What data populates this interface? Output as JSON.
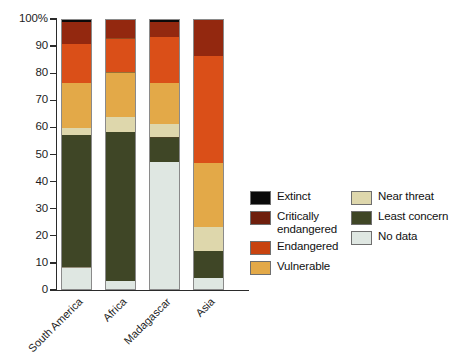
{
  "chart_data": {
    "type": "bar",
    "subtype": "stacked-percentage-column",
    "title": "",
    "xlabel": "",
    "ylabel": "",
    "ylim": [
      0,
      100
    ],
    "yticks": [
      0,
      10,
      20,
      30,
      40,
      50,
      60,
      70,
      80,
      90,
      100
    ],
    "ytick_labels": [
      "0",
      "10",
      "20",
      "30",
      "40",
      "50",
      "60",
      "70",
      "80",
      "90",
      "100%"
    ],
    "grid": false,
    "legend_position": "right",
    "categories": [
      "South America",
      "Africa",
      "Madagascar",
      "Asia"
    ],
    "series": [
      {
        "name": "No data",
        "color": "#dfe7e2",
        "values": [
          8.0,
          3.0,
          47.0,
          4.0
        ]
      },
      {
        "name": "Least concern",
        "color": "#3f4626",
        "values": [
          49.0,
          55.0,
          9.0,
          10.0
        ]
      },
      {
        "name": "Near threat",
        "color": "#ded7ac",
        "values": [
          2.5,
          5.5,
          5.0,
          9.0
        ]
      },
      {
        "name": "Vulnerable",
        "color": "#e3a948",
        "values": [
          16.5,
          16.5,
          15.0,
          23.5
        ]
      },
      {
        "name": "Endangered",
        "color": "#da4f18",
        "values": [
          14.5,
          12.5,
          17.0,
          39.5
        ]
      },
      {
        "name": "Critically endangered",
        "color": "#93280f",
        "values": [
          8.0,
          7.0,
          5.5,
          14.0
        ]
      },
      {
        "name": "Extinct",
        "color": "#0a0a0a",
        "values": [
          1.5,
          0.5,
          1.5,
          0.0
        ]
      }
    ]
  },
  "axis": {
    "y_unit_suffix": "%",
    "y_top_label": "100%"
  },
  "legend": {
    "columns": [
      {
        "items": [
          {
            "label": "Extinct",
            "color": "#0a0a0a"
          },
          {
            "label": "Critically endangered",
            "color": "#6f1f0d"
          },
          {
            "label": "Endangered",
            "color": "#c8430f"
          },
          {
            "label": "Vulnerable",
            "color": "#e3a948"
          }
        ]
      },
      {
        "items": [
          {
            "label": "Near threat",
            "color": "#ded7ac"
          },
          {
            "label": "Least concern",
            "color": "#3f4626"
          },
          {
            "label": "No data",
            "color": "#dfe7e2"
          }
        ]
      }
    ]
  }
}
